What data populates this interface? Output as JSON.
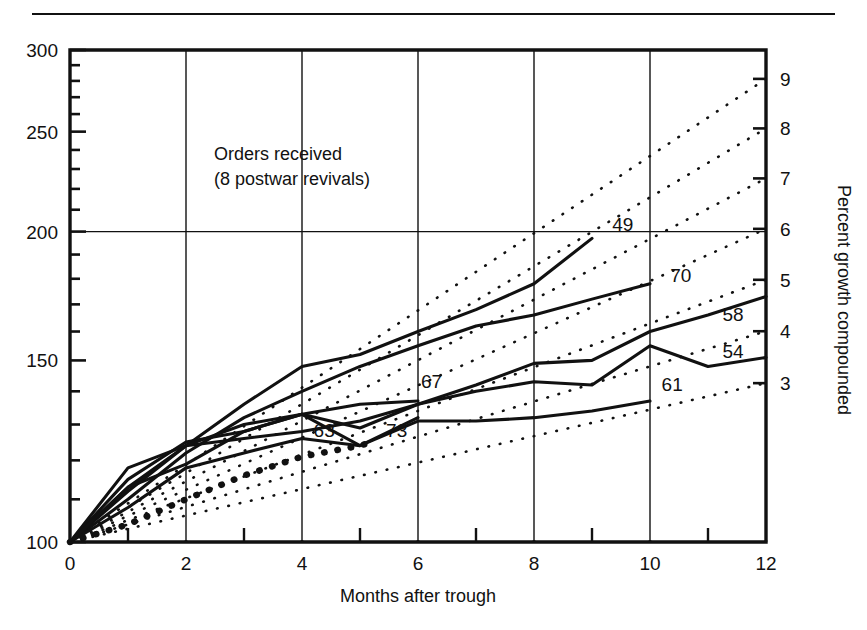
{
  "figure": {
    "top_rule": true,
    "background": "#ffffff",
    "ink": "#111111"
  },
  "chart_data": {
    "type": "line",
    "title": "",
    "annotation": {
      "line1": "Orders received",
      "line2": "(8 postwar revivals)"
    },
    "xlabel": "Months after trough",
    "ylabel": "",
    "ylabel_right": "Percent growth compounded",
    "xlim": [
      0,
      12
    ],
    "ylim": [
      100,
      300
    ],
    "y_scale": "log",
    "grid": true,
    "x_ticks_major": [
      0,
      2,
      4,
      6,
      8,
      10,
      12
    ],
    "x_ticks_minor": [
      1,
      3,
      5,
      7,
      9,
      11
    ],
    "y_ticks_major": [
      100,
      150,
      200,
      250,
      300
    ],
    "y_ticks_minor": [
      110,
      120,
      130,
      140,
      160,
      170,
      180,
      190,
      210,
      220,
      230,
      240,
      260,
      270,
      280,
      290
    ],
    "right_axis": {
      "label": "Percent growth compounded",
      "ticks": [
        3,
        4,
        5,
        6,
        7,
        8,
        9,
        10
      ],
      "note": "compound annual percent growth; value v at 12 months = 100*(1+p/100)^12"
    },
    "legend_position": "inline-end-labels",
    "series": [
      {
        "name": "49",
        "style": "solid",
        "label_x": 9.35,
        "label_y": 203,
        "points": [
          {
            "x": 0,
            "y": 100
          },
          {
            "x": 1,
            "y": 113
          },
          {
            "x": 2,
            "y": 124
          },
          {
            "x": 3,
            "y": 136
          },
          {
            "x": 4,
            "y": 148
          },
          {
            "x": 5,
            "y": 152
          },
          {
            "x": 6,
            "y": 160
          },
          {
            "x": 7,
            "y": 168
          },
          {
            "x": 8,
            "y": 178
          },
          {
            "x": 9,
            "y": 197
          }
        ]
      },
      {
        "name": "70",
        "style": "solid",
        "label_x": 10.35,
        "label_y": 181,
        "points": [
          {
            "x": 0,
            "y": 100
          },
          {
            "x": 1,
            "y": 110
          },
          {
            "x": 2,
            "y": 122
          },
          {
            "x": 3,
            "y": 132
          },
          {
            "x": 4,
            "y": 140
          },
          {
            "x": 5,
            "y": 148
          },
          {
            "x": 6,
            "y": 155
          },
          {
            "x": 7,
            "y": 162
          },
          {
            "x": 8,
            "y": 166
          },
          {
            "x": 9,
            "y": 172
          },
          {
            "x": 10,
            "y": 178
          }
        ]
      },
      {
        "name": "58",
        "style": "solid",
        "label_x": 11.25,
        "label_y": 166,
        "points": [
          {
            "x": 0,
            "y": 100
          },
          {
            "x": 1,
            "y": 112
          },
          {
            "x": 2,
            "y": 124
          },
          {
            "x": 3,
            "y": 126
          },
          {
            "x": 4,
            "y": 128
          },
          {
            "x": 5,
            "y": 131
          },
          {
            "x": 6,
            "y": 136
          },
          {
            "x": 7,
            "y": 142
          },
          {
            "x": 8,
            "y": 149
          },
          {
            "x": 9,
            "y": 150
          },
          {
            "x": 10,
            "y": 160
          },
          {
            "x": 11,
            "y": 166
          },
          {
            "x": 12,
            "y": 173
          }
        ]
      },
      {
        "name": "54",
        "style": "solid",
        "label_x": 11.25,
        "label_y": 153,
        "points": [
          {
            "x": 0,
            "y": 100
          },
          {
            "x": 1,
            "y": 115
          },
          {
            "x": 2,
            "y": 125
          },
          {
            "x": 3,
            "y": 128
          },
          {
            "x": 4,
            "y": 133
          },
          {
            "x": 5,
            "y": 129
          },
          {
            "x": 6,
            "y": 136
          },
          {
            "x": 7,
            "y": 140
          },
          {
            "x": 8,
            "y": 143
          },
          {
            "x": 9,
            "y": 142
          },
          {
            "x": 10,
            "y": 155
          },
          {
            "x": 11,
            "y": 148
          },
          {
            "x": 12,
            "y": 151
          }
        ]
      },
      {
        "name": "61",
        "style": "solid",
        "label_x": 10.2,
        "label_y": 142,
        "points": [
          {
            "x": 0,
            "y": 100
          },
          {
            "x": 1,
            "y": 108
          },
          {
            "x": 2,
            "y": 118
          },
          {
            "x": 3,
            "y": 122
          },
          {
            "x": 4,
            "y": 126
          },
          {
            "x": 5,
            "y": 124
          },
          {
            "x": 6,
            "y": 131
          },
          {
            "x": 7,
            "y": 131
          },
          {
            "x": 8,
            "y": 132
          },
          {
            "x": 9,
            "y": 134
          },
          {
            "x": 10,
            "y": 137
          }
        ]
      },
      {
        "name": "67",
        "style": "solid",
        "label_x": 6.05,
        "label_y": 143,
        "points": [
          {
            "x": 0,
            "y": 100
          },
          {
            "x": 1,
            "y": 118
          },
          {
            "x": 2,
            "y": 124
          },
          {
            "x": 3,
            "y": 130
          },
          {
            "x": 4,
            "y": 133
          },
          {
            "x": 5,
            "y": 136
          },
          {
            "x": 6,
            "y": 137
          }
        ]
      },
      {
        "name": "63",
        "style": "solid",
        "label_x": 4.2,
        "label_y": 128,
        "points": [
          {
            "x": 0,
            "y": 100
          },
          {
            "x": 1,
            "y": 113
          },
          {
            "x": 2,
            "y": 119
          },
          {
            "x": 3,
            "y": 128
          },
          {
            "x": 4,
            "y": 133
          },
          {
            "x": 5,
            "y": 124
          },
          {
            "x": 6,
            "y": 132
          }
        ]
      },
      {
        "name": "73",
        "style": "dotted-bold",
        "label_x": 5.45,
        "label_y": 128,
        "points": [
          {
            "x": 0,
            "y": 100
          },
          {
            "x": 1,
            "y": 104
          },
          {
            "x": 2,
            "y": 110
          },
          {
            "x": 3,
            "y": 116
          },
          {
            "x": 4,
            "y": 121
          },
          {
            "x": 5,
            "y": 124
          },
          {
            "x": 5.2,
            "y": 125
          }
        ]
      }
    ],
    "reference_lines": {
      "style": "dotted",
      "description": "Compound growth rate guide rays from (0,100) to 12 months",
      "rates": [
        3,
        4,
        5,
        6,
        7,
        8,
        9
      ]
    }
  }
}
